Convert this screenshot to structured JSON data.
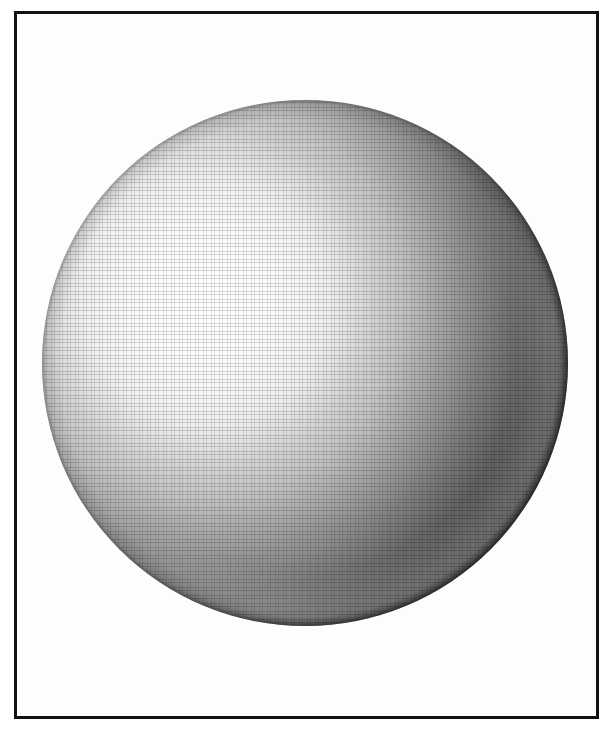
{
  "figure": {
    "kind": "shaded-sphere-illustration",
    "caption": "",
    "background_color": "#ffffff",
    "plate_color": "#fdfdfd",
    "frame": {
      "border_color": "#111111",
      "border_width_px": 3,
      "left_px": 14,
      "top_px": 11,
      "width_px": 585,
      "height_px": 708
    },
    "sphere": {
      "center_x_px": 305,
      "center_y_px": 363,
      "radius_px": 263,
      "highlight_x_px": 205,
      "highlight_y_px": 300,
      "highlight_color": "#ffffff",
      "midtone_color": "#b4b4b4",
      "terminator_color": "#4a4a4a",
      "shadow_color": "#0d0d0d",
      "rim_light_color": "#6e6e6e",
      "light_direction": "upper-left",
      "surface_texture": "halftone-grain"
    }
  },
  "chart_data": {
    "type": "scatter",
    "title": "",
    "xlabel": "",
    "ylabel": "",
    "grid": false,
    "legend": "none",
    "xlim": [
      0,
      606
    ],
    "ylim": [
      0,
      730
    ],
    "annotations": [],
    "luminance_profile": {
      "comment": "Sampled greyscale values along the light axis from highlight to terminal shadow.",
      "stops_percent": [
        0,
        12,
        26,
        42,
        58,
        72,
        86,
        96,
        100
      ],
      "grey_values": [
        255,
        252,
        238,
        196,
        138,
        78,
        34,
        16,
        13
      ]
    },
    "rim_light_profile": {
      "comment": "Secondary brightening along the lower-right limb.",
      "stops_percent": [
        80,
        88,
        94,
        100
      ],
      "grey_values": [
        18,
        46,
        88,
        54
      ]
    }
  }
}
